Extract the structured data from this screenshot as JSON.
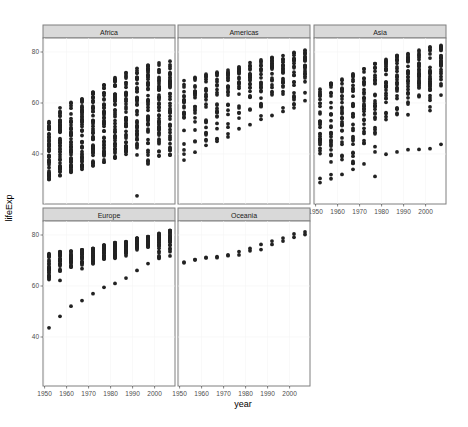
{
  "chart_data": {
    "type": "scatter",
    "title": "",
    "xlabel": "year",
    "ylabel": "lifeExp",
    "facet_by": "continent",
    "facets": [
      "Africa",
      "Americas",
      "Asia",
      "Europe",
      "Oceania"
    ],
    "x_ticks": [
      1950,
      1960,
      1970,
      1980,
      1990,
      2000
    ],
    "y_ticks": [
      40,
      60,
      80
    ],
    "xlim": [
      1950,
      2009
    ],
    "ylim": [
      21,
      87
    ],
    "grid": true,
    "legend": "none",
    "point_color": "#222222",
    "years": [
      1952,
      1957,
      1962,
      1967,
      1972,
      1977,
      1982,
      1987,
      1992,
      1997,
      2002,
      2007
    ],
    "series": [
      {
        "name": "Africa",
        "min": [
          30,
          31.5,
          32.8,
          34,
          35.4,
          36.8,
          38.4,
          39.9,
          23.6,
          36.1,
          39.2,
          39.6
        ],
        "max": [
          52.7,
          58.1,
          60.2,
          61.6,
          64.3,
          67.1,
          69.9,
          71.9,
          73.6,
          74.8,
          75.7,
          76.4
        ]
      },
      {
        "name": "Americas",
        "min": [
          37.6,
          40.7,
          43.4,
          45,
          46.7,
          49.9,
          51.5,
          53.6,
          55.1,
          56.7,
          58.1,
          60.9
        ],
        "max": [
          68.8,
          70,
          71.3,
          72.1,
          72.9,
          74.2,
          75.8,
          76.9,
          77.9,
          78.6,
          79.8,
          80.7
        ]
      },
      {
        "name": "Asia",
        "min": [
          28.8,
          30.3,
          32,
          34,
          36.1,
          31.2,
          39.9,
          40.8,
          41.7,
          41.8,
          42.1,
          43.8
        ],
        "max": [
          65.4,
          67.8,
          69.4,
          71.4,
          73.4,
          75.4,
          77.1,
          78.7,
          79.4,
          80.7,
          82,
          82.6
        ]
      },
      {
        "name": "Europe",
        "min": [
          43.6,
          48.1,
          52.1,
          54.3,
          57,
          59.5,
          61,
          63.1,
          66.1,
          68.8,
          70.8,
          71.8
        ],
        "max": [
          72.7,
          73.5,
          73.7,
          74.2,
          74.7,
          76.1,
          76.99,
          77.4,
          78.8,
          79.4,
          80.6,
          81.8
        ]
      },
      {
        "name": "Oceania",
        "min": [
          69.1,
          70.3,
          71.0,
          71.1,
          71.9,
          72.2,
          73.8,
          74.3,
          76.3,
          77.6,
          79.1,
          80.2
        ],
        "max": [
          69.4,
          70.3,
          71.2,
          71.5,
          72.2,
          73.5,
          74.7,
          76.3,
          77.6,
          78.8,
          80.4,
          81.2
        ]
      }
    ]
  },
  "labels": {
    "xlabel": "year",
    "ylabel": "lifeExp",
    "strips": [
      "Africa",
      "Americas",
      "Asia",
      "Europe",
      "Oceania"
    ]
  }
}
